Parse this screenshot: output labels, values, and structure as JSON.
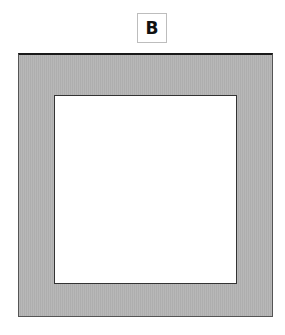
{
  "label": {
    "text": "B"
  },
  "colors": {
    "frame_fill": "#b3b3b3",
    "frame_border": "#555555",
    "top_edge": "#1a1a1a",
    "inner_fill": "#ffffff",
    "label_border": "#bdbdbd"
  }
}
